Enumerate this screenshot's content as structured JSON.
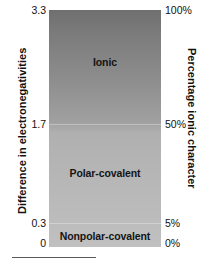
{
  "chart_data": {
    "type": "bar",
    "orientation": "vertical",
    "left_axis": {
      "label": "Difference in electronegativities",
      "ticks": [
        "3.3",
        "1.7",
        "0.3",
        "0"
      ],
      "values": [
        3.3,
        1.7,
        0.3,
        0
      ],
      "range": [
        0,
        3.3
      ]
    },
    "right_axis": {
      "label": "Percentage ionic character",
      "ticks": [
        "100%",
        "50%",
        "5%",
        "0%"
      ],
      "values": [
        100,
        50,
        5,
        0
      ],
      "range": [
        0,
        100
      ]
    },
    "regions": [
      {
        "name": "Ionic",
        "en_min": 1.7,
        "en_max": 3.3,
        "ionic_min": 50,
        "ionic_max": 100
      },
      {
        "name": "Polar-covalent",
        "en_min": 0.3,
        "en_max": 1.7,
        "ionic_min": 5,
        "ionic_max": 50
      },
      {
        "name": "Nonpolar-covalent",
        "en_min": 0.0,
        "en_max": 0.3,
        "ionic_min": 0,
        "ionic_max": 5
      }
    ],
    "gradient": {
      "top_color": "#6f6f6f",
      "bottom_color": "#c0c0c0"
    },
    "grid": false,
    "legend": "none"
  },
  "axes": {
    "left_title": "Difference in electronegativities",
    "right_title": "Percentage ionic character"
  },
  "ticks": {
    "left": {
      "top": "3.3",
      "mid": "1.7",
      "low": "0.3",
      "zero": "0"
    },
    "right": {
      "top": "100%",
      "mid": "50%",
      "low": "5%",
      "zero": "0%"
    }
  },
  "regions": {
    "ionic": "Ionic",
    "polar_covalent": "Polar-covalent",
    "nonpolar_covalent": "Nonpolar-covalent"
  },
  "colors": {
    "gradient_top": "#6f6f6f",
    "gradient_bottom": "#c0c0c0",
    "text": "#111111",
    "rule": "#5a5a5a"
  }
}
